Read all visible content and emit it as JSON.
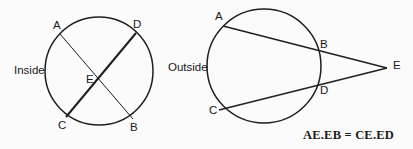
{
  "figure": {
    "background_color": "#fbfbfb",
    "stroke_color": "#1f1f1f",
    "text_color": "#191919"
  },
  "inside_diagram": {
    "region_label": "Inside",
    "circle": {
      "cx": 99,
      "cy": 71,
      "r": 54
    },
    "points": [
      {
        "name": "A",
        "label": "A",
        "x": 60,
        "y": 34,
        "label_x": 53,
        "label_y": 20
      },
      {
        "name": "D",
        "label": "D",
        "x": 136,
        "y": 33,
        "label_x": 133,
        "label_y": 19
      },
      {
        "name": "C",
        "label": "C",
        "x": 66,
        "y": 117,
        "label_x": 58,
        "label_y": 120
      },
      {
        "name": "B",
        "label": "B",
        "x": 133,
        "y": 119,
        "label_x": 130,
        "label_y": 122
      },
      {
        "name": "E",
        "label": "E",
        "x": 103,
        "y": 82,
        "label_x": 86,
        "label_y": 74
      }
    ],
    "chords": [
      {
        "name": "chord-AB",
        "from": "A",
        "to": "B",
        "width": 1
      },
      {
        "name": "chord-DC",
        "from": "D",
        "to": "C",
        "width": 2
      }
    ]
  },
  "outside_diagram": {
    "region_label": "Outside",
    "circle": {
      "cx": 264,
      "cy": 66,
      "r": 57
    },
    "points": [
      {
        "name": "A",
        "label": "A",
        "x": 223,
        "y": 26,
        "label_x": 215,
        "label_y": 11
      },
      {
        "name": "B",
        "label": "B",
        "x": 317,
        "y": 45,
        "label_x": 320,
        "label_y": 39
      },
      {
        "name": "C",
        "label": "C",
        "x": 219,
        "y": 110,
        "label_x": 209,
        "label_y": 105
      },
      {
        "name": "D",
        "label": "D",
        "x": 318,
        "y": 88,
        "label_x": 320,
        "label_y": 85
      },
      {
        "name": "E",
        "label": "E",
        "x": 387,
        "y": 68,
        "label_x": 393,
        "label_y": 60
      }
    ],
    "secants": [
      {
        "name": "secant-AE",
        "from": "A",
        "to": "E",
        "width": 1.4
      },
      {
        "name": "secant-CE",
        "from": "C",
        "to": "E",
        "width": 1.4
      }
    ]
  },
  "formula": {
    "text": "AE.EB = CE.ED",
    "x": 303,
    "y": 128
  }
}
